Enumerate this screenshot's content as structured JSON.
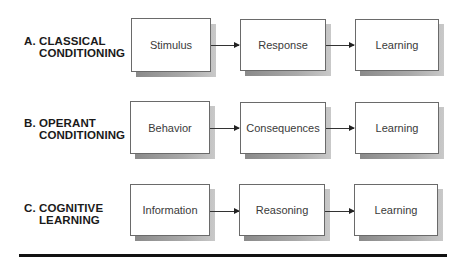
{
  "rows": [
    {
      "label_letter": "A.",
      "label_line1": "CLASSICAL",
      "label_line2": "CONDITIONING",
      "boxes": [
        "Stimulus",
        "Response",
        "Learning"
      ]
    },
    {
      "label_letter": "B.",
      "label_line1": "OPERANT",
      "label_line2": "CONDITIONING",
      "boxes": [
        "Behavior",
        "Consequences",
        "Learning"
      ]
    },
    {
      "label_letter": "C.",
      "label_line1": "COGNITIVE",
      "label_line2": "LEARNING",
      "boxes": [
        "Information",
        "Reasoning",
        "Learning"
      ]
    }
  ],
  "colors": {
    "box_border": "#6a6a6a",
    "shadow": "#999999",
    "rule": "#111111"
  }
}
